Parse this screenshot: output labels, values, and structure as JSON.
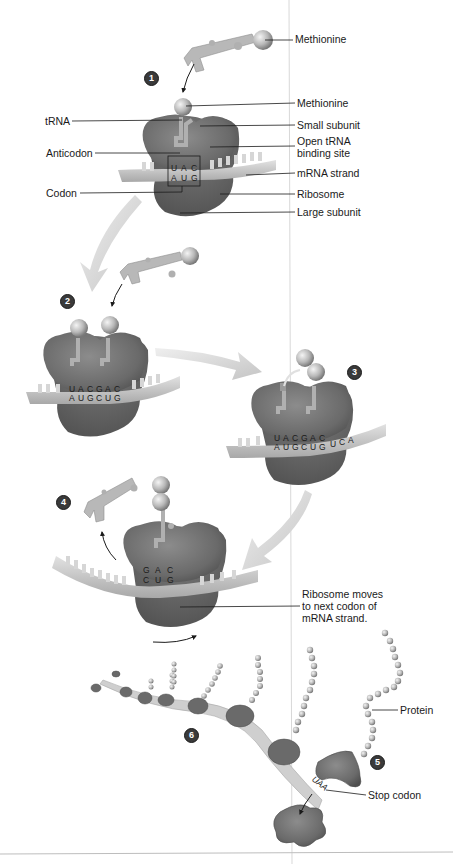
{
  "colors": {
    "ribosome_dark": "#6e6e6e",
    "ribosome_mid": "#8a8a8a",
    "mrna_strand": "#c8c8c8",
    "trna": "#b4b4b4",
    "amino_acid": "#bdbdbd",
    "process_arrow": "#d6d6d6",
    "badge_bg": "#3a3a3a",
    "badge_text": "#ffffff",
    "label_text": "#1a1a1a",
    "background": "#ffffff"
  },
  "steps": [
    {
      "number": "1"
    },
    {
      "number": "2"
    },
    {
      "number": "3"
    },
    {
      "number": "4"
    },
    {
      "number": "5"
    },
    {
      "number": "6"
    }
  ],
  "step1": {
    "labels": {
      "methionine_free": "Methionine",
      "methionine_bound": "Methionine",
      "trna": "tRNA",
      "small_subunit": "Small subunit",
      "open_site": "Open tRNA binding site",
      "anticodon": "Anticodon",
      "mrna_strand": "mRNA strand",
      "codon": "Codon",
      "ribosome": "Ribosome",
      "large_subunit": "Large subunit"
    },
    "anticodon_bases": [
      "U",
      "A",
      "C"
    ],
    "codon_bases": [
      "A",
      "U",
      "G"
    ]
  },
  "step2": {
    "anticodon_bases": [
      "U",
      "A",
      "C",
      "G",
      "A",
      "C"
    ],
    "codon_bases": [
      "A",
      "U",
      "G",
      "C",
      "U",
      "G"
    ]
  },
  "step3": {
    "anticodon_bases": [
      "U",
      "A",
      "C",
      "G",
      "A",
      "C"
    ],
    "codon_bases": [
      "A",
      "U",
      "G",
      "C",
      "U",
      "G"
    ],
    "next_bases": [
      "U",
      "C",
      "A"
    ]
  },
  "step4": {
    "anticodon_bases": [
      "G",
      "A",
      "C"
    ],
    "codon_bases": [
      "C",
      "U",
      "G"
    ],
    "labels": {
      "ribosome_moves": "Ribosome moves to next codon of mRNA strand."
    }
  },
  "step5_6": {
    "labels": {
      "protein": "Protein",
      "stop_codon": "Stop codon",
      "stop_sequence": "UAA"
    }
  }
}
